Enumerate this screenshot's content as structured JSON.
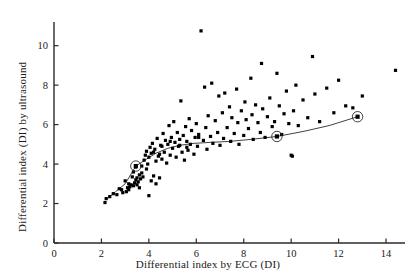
{
  "chart_data": {
    "type": "scatter",
    "title": "",
    "xlabel": "Differential index by ECG (DI)",
    "ylabel": "Differential index (DI) by ultrasound",
    "xlim": [
      0,
      14.8
    ],
    "ylim": [
      0,
      11.2
    ],
    "xticks": [
      0,
      2,
      4,
      6,
      8,
      10,
      12,
      14
    ],
    "yticks": [
      0,
      2,
      4,
      6,
      8,
      10
    ],
    "xticklabels": [
      "0",
      "2",
      "4",
      "6",
      "8",
      "10",
      "12",
      "14"
    ],
    "yticklabels": [
      "0",
      "2",
      "4",
      "6",
      "8",
      "10"
    ],
    "grid": false,
    "legend": null,
    "marker": "filled-square",
    "marker_color": "#000000",
    "series": [
      {
        "name": "patients",
        "type": "scatter",
        "points": [
          [
            2.15,
            2.05
          ],
          [
            2.2,
            2.25
          ],
          [
            2.5,
            2.5
          ],
          [
            2.65,
            2.45
          ],
          [
            2.75,
            2.75
          ],
          [
            2.9,
            2.55
          ],
          [
            3.0,
            3.15
          ],
          [
            3.05,
            2.6
          ],
          [
            3.1,
            2.8
          ],
          [
            3.15,
            3.0
          ],
          [
            3.2,
            2.85
          ],
          [
            3.25,
            2.95
          ],
          [
            3.3,
            3.35
          ],
          [
            3.35,
            2.9
          ],
          [
            3.4,
            3.05
          ],
          [
            3.45,
            3.2
          ],
          [
            3.5,
            3.3
          ],
          [
            3.5,
            2.95
          ],
          [
            3.55,
            3.1
          ],
          [
            3.6,
            3.45
          ],
          [
            3.6,
            2.8
          ],
          [
            3.65,
            3.25
          ],
          [
            3.7,
            3.55
          ],
          [
            3.7,
            3.9
          ],
          [
            3.75,
            3.35
          ],
          [
            3.8,
            4.2
          ],
          [
            3.85,
            4.45
          ],
          [
            3.9,
            3.75
          ],
          [
            3.9,
            4.65
          ],
          [
            3.95,
            4.0
          ],
          [
            4.0,
            2.4
          ],
          [
            4.0,
            4.35
          ],
          [
            4.05,
            4.85
          ],
          [
            4.1,
            3.15
          ],
          [
            4.1,
            4.55
          ],
          [
            4.15,
            5.05
          ],
          [
            4.2,
            3.4
          ],
          [
            4.25,
            4.75
          ],
          [
            4.3,
            3.0
          ],
          [
            4.3,
            4.15
          ],
          [
            4.35,
            5.3
          ],
          [
            4.4,
            4.4
          ],
          [
            4.45,
            3.3
          ],
          [
            4.5,
            4.95
          ],
          [
            4.55,
            4.25
          ],
          [
            4.6,
            5.55
          ],
          [
            4.65,
            4.6
          ],
          [
            4.7,
            5.2
          ],
          [
            4.75,
            4.05
          ],
          [
            4.8,
            5.0
          ],
          [
            4.85,
            5.95
          ],
          [
            4.9,
            4.45
          ],
          [
            4.95,
            5.35
          ],
          [
            5.0,
            4.8
          ],
          [
            5.05,
            6.15
          ],
          [
            5.1,
            5.1
          ],
          [
            5.15,
            4.35
          ],
          [
            5.2,
            5.6
          ],
          [
            5.25,
            4.9
          ],
          [
            5.3,
            5.25
          ],
          [
            5.35,
            7.2
          ],
          [
            5.4,
            4.6
          ],
          [
            5.45,
            5.45
          ],
          [
            5.5,
            4.2
          ],
          [
            5.55,
            5.9
          ],
          [
            5.6,
            5.15
          ],
          [
            5.65,
            4.7
          ],
          [
            5.7,
            6.3
          ],
          [
            5.75,
            5.0
          ],
          [
            5.8,
            5.7
          ],
          [
            5.9,
            4.5
          ],
          [
            5.95,
            5.35
          ],
          [
            6.0,
            6.05
          ],
          [
            6.05,
            4.9
          ],
          [
            6.1,
            5.5
          ],
          [
            6.2,
            10.75
          ],
          [
            6.3,
            5.2
          ],
          [
            6.35,
            7.9
          ],
          [
            6.4,
            5.85
          ],
          [
            6.45,
            4.75
          ],
          [
            6.5,
            6.45
          ],
          [
            6.6,
            5.4
          ],
          [
            6.65,
            8.1
          ],
          [
            6.7,
            5.05
          ],
          [
            6.8,
            6.2
          ],
          [
            6.9,
            5.6
          ],
          [
            6.95,
            7.45
          ],
          [
            7.0,
            4.95
          ],
          [
            7.1,
            6.6
          ],
          [
            7.15,
            5.3
          ],
          [
            7.2,
            7.6
          ],
          [
            7.3,
            5.85
          ],
          [
            7.4,
            6.9
          ],
          [
            7.45,
            5.15
          ],
          [
            7.5,
            6.35
          ],
          [
            7.6,
            5.55
          ],
          [
            7.7,
            7.8
          ],
          [
            7.75,
            6.1
          ],
          [
            7.8,
            5.0
          ],
          [
            7.9,
            6.7
          ],
          [
            8.0,
            5.45
          ],
          [
            8.05,
            7.15
          ],
          [
            8.1,
            6.25
          ],
          [
            8.2,
            5.8
          ],
          [
            8.3,
            8.35
          ],
          [
            8.35,
            6.5
          ],
          [
            8.4,
            5.25
          ],
          [
            8.5,
            7.0
          ],
          [
            8.6,
            6.1
          ],
          [
            8.7,
            5.6
          ],
          [
            8.75,
            9.1
          ],
          [
            8.8,
            6.8
          ],
          [
            8.9,
            5.35
          ],
          [
            9.0,
            6.4
          ],
          [
            9.1,
            7.35
          ],
          [
            9.2,
            5.9
          ],
          [
            9.3,
            6.15
          ],
          [
            9.4,
            8.6
          ],
          [
            9.5,
            6.95
          ],
          [
            9.6,
            5.5
          ],
          [
            9.7,
            6.55
          ],
          [
            9.8,
            7.7
          ],
          [
            9.9,
            6.05
          ],
          [
            10.0,
            4.45
          ],
          [
            10.05,
            4.4
          ],
          [
            10.1,
            6.7
          ],
          [
            10.2,
            8.0
          ],
          [
            10.3,
            5.95
          ],
          [
            10.5,
            7.25
          ],
          [
            10.7,
            6.35
          ],
          [
            10.9,
            9.45
          ],
          [
            11.0,
            7.55
          ],
          [
            11.2,
            6.15
          ],
          [
            11.5,
            7.85
          ],
          [
            11.8,
            6.6
          ],
          [
            12.0,
            8.25
          ],
          [
            12.3,
            6.95
          ],
          [
            12.6,
            6.85
          ],
          [
            13.0,
            7.45
          ],
          [
            14.4,
            8.75
          ],
          [
            3.35,
            3.6
          ],
          [
            3.45,
            3.85
          ],
          [
            4.55,
            4.9
          ],
          [
            5.3,
            4.95
          ],
          [
            6.1,
            5.35
          ],
          [
            4.2,
            4.6
          ],
          [
            4.9,
            5.15
          ],
          [
            5.6,
            4.85
          ],
          [
            2.35,
            2.35
          ],
          [
            2.85,
            2.7
          ],
          [
            3.15,
            2.7
          ],
          [
            4.45,
            4.5
          ]
        ]
      },
      {
        "name": "mean-trend",
        "type": "line",
        "note": "smoothed curve through means with circled nodes",
        "circled_points": [
          [
            3.45,
            3.9
          ],
          [
            9.4,
            5.4
          ],
          [
            12.8,
            6.4
          ]
        ],
        "path": [
          [
            2.2,
            2.2
          ],
          [
            2.6,
            2.6
          ],
          [
            3.0,
            3.0
          ],
          [
            3.45,
            3.9
          ],
          [
            3.9,
            4.25
          ],
          [
            4.3,
            4.55
          ],
          [
            4.8,
            4.8
          ],
          [
            5.3,
            4.95
          ],
          [
            5.9,
            5.05
          ],
          [
            6.6,
            5.1
          ],
          [
            7.4,
            5.15
          ],
          [
            8.3,
            5.25
          ],
          [
            9.4,
            5.4
          ],
          [
            10.5,
            5.65
          ],
          [
            11.6,
            5.95
          ],
          [
            12.8,
            6.4
          ]
        ]
      }
    ]
  }
}
